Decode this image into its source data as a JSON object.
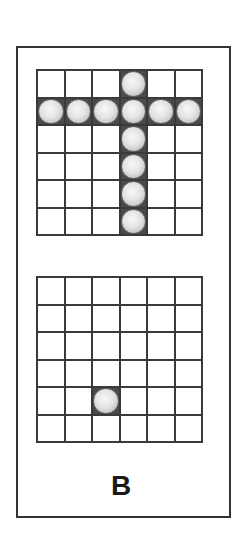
{
  "figure": {
    "label": "B",
    "colors": {
      "line": "#3a3a3a",
      "ball": "#e4e4e4",
      "background": "#ffffff"
    }
  },
  "grids": [
    {
      "name": "top-grid",
      "rows": 6,
      "cols": 6,
      "balls": [
        [
          0,
          3
        ],
        [
          1,
          0
        ],
        [
          1,
          1
        ],
        [
          1,
          2
        ],
        [
          1,
          3
        ],
        [
          1,
          4
        ],
        [
          1,
          5
        ],
        [
          2,
          3
        ],
        [
          3,
          3
        ],
        [
          4,
          3
        ],
        [
          5,
          3
        ]
      ]
    },
    {
      "name": "bottom-grid",
      "rows": 6,
      "cols": 6,
      "balls": [
        [
          4,
          2
        ]
      ]
    }
  ]
}
